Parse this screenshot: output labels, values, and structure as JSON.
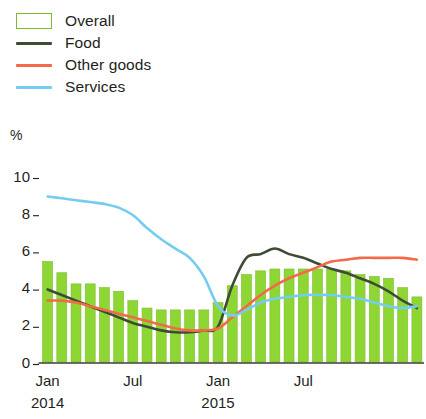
{
  "legend": {
    "items": [
      {
        "label": "Overall",
        "type": "swatch",
        "color": "#8ed634"
      },
      {
        "label": "Food",
        "type": "line",
        "color": "#3f4c35"
      },
      {
        "label": "Other goods",
        "type": "line",
        "color": "#f36a4a"
      },
      {
        "label": "Services",
        "type": "line",
        "color": "#74cdee"
      }
    ]
  },
  "axes": {
    "unit": "%",
    "y_ticks": [
      "10",
      "8",
      "6",
      "4",
      "2",
      "0"
    ],
    "x_ticks": [
      {
        "label": "Jan",
        "sub": "2014"
      },
      {
        "label": "Jul",
        "sub": ""
      },
      {
        "label": "Jan",
        "sub": "2015"
      },
      {
        "label": "Jul",
        "sub": ""
      }
    ]
  },
  "chart_data": {
    "type": "bar",
    "title": "",
    "subtitle": "",
    "xlabel": "",
    "ylabel": "%",
    "ylim": [
      0,
      10
    ],
    "grid": false,
    "legend_position": "top-left",
    "categories": [
      "Jan 2014",
      "Feb 2014",
      "Mar 2014",
      "Apr 2014",
      "May 2014",
      "Jun 2014",
      "Jul 2014",
      "Aug 2014",
      "Sep 2014",
      "Oct 2014",
      "Nov 2014",
      "Dec 2014",
      "Jan 2015",
      "Feb 2015",
      "Mar 2015",
      "Apr 2015",
      "May 2015",
      "Jun 2015",
      "Jul 2015",
      "Aug 2015",
      "Sep 2015",
      "Oct 2015",
      "Nov 2015",
      "Dec 2015",
      "Jan 2016",
      "Feb 2016",
      "Mar 2016"
    ],
    "series": [
      {
        "name": "Overall",
        "type": "bar",
        "color": "#8ed634",
        "values": [
          5.4,
          4.8,
          4.2,
          4.2,
          4.0,
          3.8,
          3.3,
          2.9,
          2.8,
          2.8,
          2.8,
          2.8,
          3.2,
          4.1,
          4.7,
          4.9,
          5.0,
          5.0,
          5.0,
          5.0,
          5.0,
          4.9,
          4.7,
          4.6,
          4.5,
          4.0,
          3.5
        ]
      },
      {
        "name": "Food",
        "type": "line",
        "color": "#3f4c35",
        "values": [
          3.9,
          3.6,
          3.3,
          3.0,
          2.7,
          2.4,
          2.1,
          1.9,
          1.7,
          1.6,
          1.6,
          1.7,
          1.9,
          4.1,
          5.6,
          5.8,
          6.1,
          5.8,
          5.6,
          5.3,
          5.0,
          4.8,
          4.5,
          4.2,
          3.8,
          3.3,
          2.9
        ]
      },
      {
        "name": "Other goods",
        "type": "line",
        "color": "#f36a4a",
        "values": [
          3.3,
          3.3,
          3.2,
          3.0,
          2.8,
          2.6,
          2.4,
          2.2,
          2.0,
          1.8,
          1.7,
          1.7,
          1.8,
          2.4,
          3.0,
          3.6,
          4.1,
          4.5,
          4.8,
          5.1,
          5.4,
          5.5,
          5.6,
          5.6,
          5.6,
          5.6,
          5.5
        ]
      },
      {
        "name": "Services",
        "type": "line",
        "color": "#74cdee",
        "values": [
          8.9,
          8.8,
          8.7,
          8.6,
          8.5,
          8.3,
          7.9,
          7.2,
          6.6,
          6.1,
          5.6,
          4.6,
          3.0,
          2.5,
          2.8,
          3.2,
          3.4,
          3.5,
          3.6,
          3.6,
          3.6,
          3.5,
          3.4,
          3.2,
          3.0,
          2.9,
          3.0
        ]
      }
    ]
  }
}
